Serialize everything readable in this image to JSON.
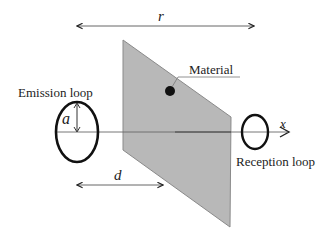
{
  "diagram": {
    "labels": {
      "r": "r",
      "d": "d",
      "a": "a",
      "x": "x",
      "material": "Material",
      "emission_loop": "Emission loop",
      "reception_loop": "Reception loop"
    },
    "colors": {
      "panel_fill": "#b8b8b8",
      "panel_stroke": "#888888",
      "line": "#555555",
      "loop": "#111111",
      "dot": "#111111",
      "text": "#222222"
    }
  }
}
